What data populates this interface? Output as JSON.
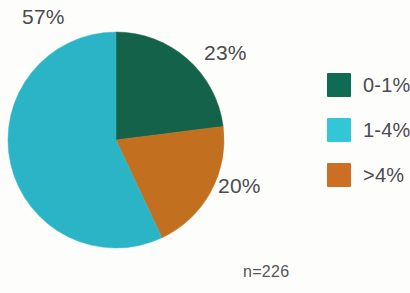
{
  "chart_data": {
    "type": "pie",
    "title": "",
    "subtitle": "",
    "xlabel": "",
    "ylabel": "",
    "grid": false,
    "legend_position": "right",
    "total_label": "n=226",
    "sample_size": 226,
    "categories": [
      "0-1%",
      "1-4%",
      ">4%"
    ],
    "values": [
      23,
      57,
      20
    ],
    "value_labels": [
      "23%",
      "57%",
      "20%"
    ],
    "colors": [
      "#14624a",
      "#2bb4c6",
      "#c2701f"
    ],
    "legend_colors": [
      "#0f6b53",
      "#33c6d6",
      "#cc6f22"
    ],
    "start_angle_deg": 0,
    "direction": "clockwise",
    "slices": [
      {
        "label": "0-1%",
        "value": 23,
        "value_label": "23%",
        "color": "#14624a",
        "legend_color": "#0f6b53",
        "start_deg": 0,
        "sweep_deg": 82.8
      },
      {
        "label": ">4%",
        "value": 20,
        "value_label": "20%",
        "color": "#c2701f",
        "legend_color": "#cc6f22",
        "start_deg": 82.8,
        "sweep_deg": 72
      },
      {
        "label": "1-4%",
        "value": 57,
        "value_label": "57%",
        "color": "#2bb4c6",
        "legend_color": "#33c6d6",
        "start_deg": 154.8,
        "sweep_deg": 205.2
      }
    ]
  },
  "labels": {
    "cyan_pct": "57%",
    "green_pct": "23%",
    "orange_pct": "20%",
    "sample_note": "n=226"
  },
  "legend": {
    "items": [
      {
        "label": "0-1%",
        "color": "#0f6b53"
      },
      {
        "label": "1-4%",
        "color": "#33c6d6"
      },
      {
        "label": ">4%",
        "color": "#cc6f22"
      }
    ]
  }
}
